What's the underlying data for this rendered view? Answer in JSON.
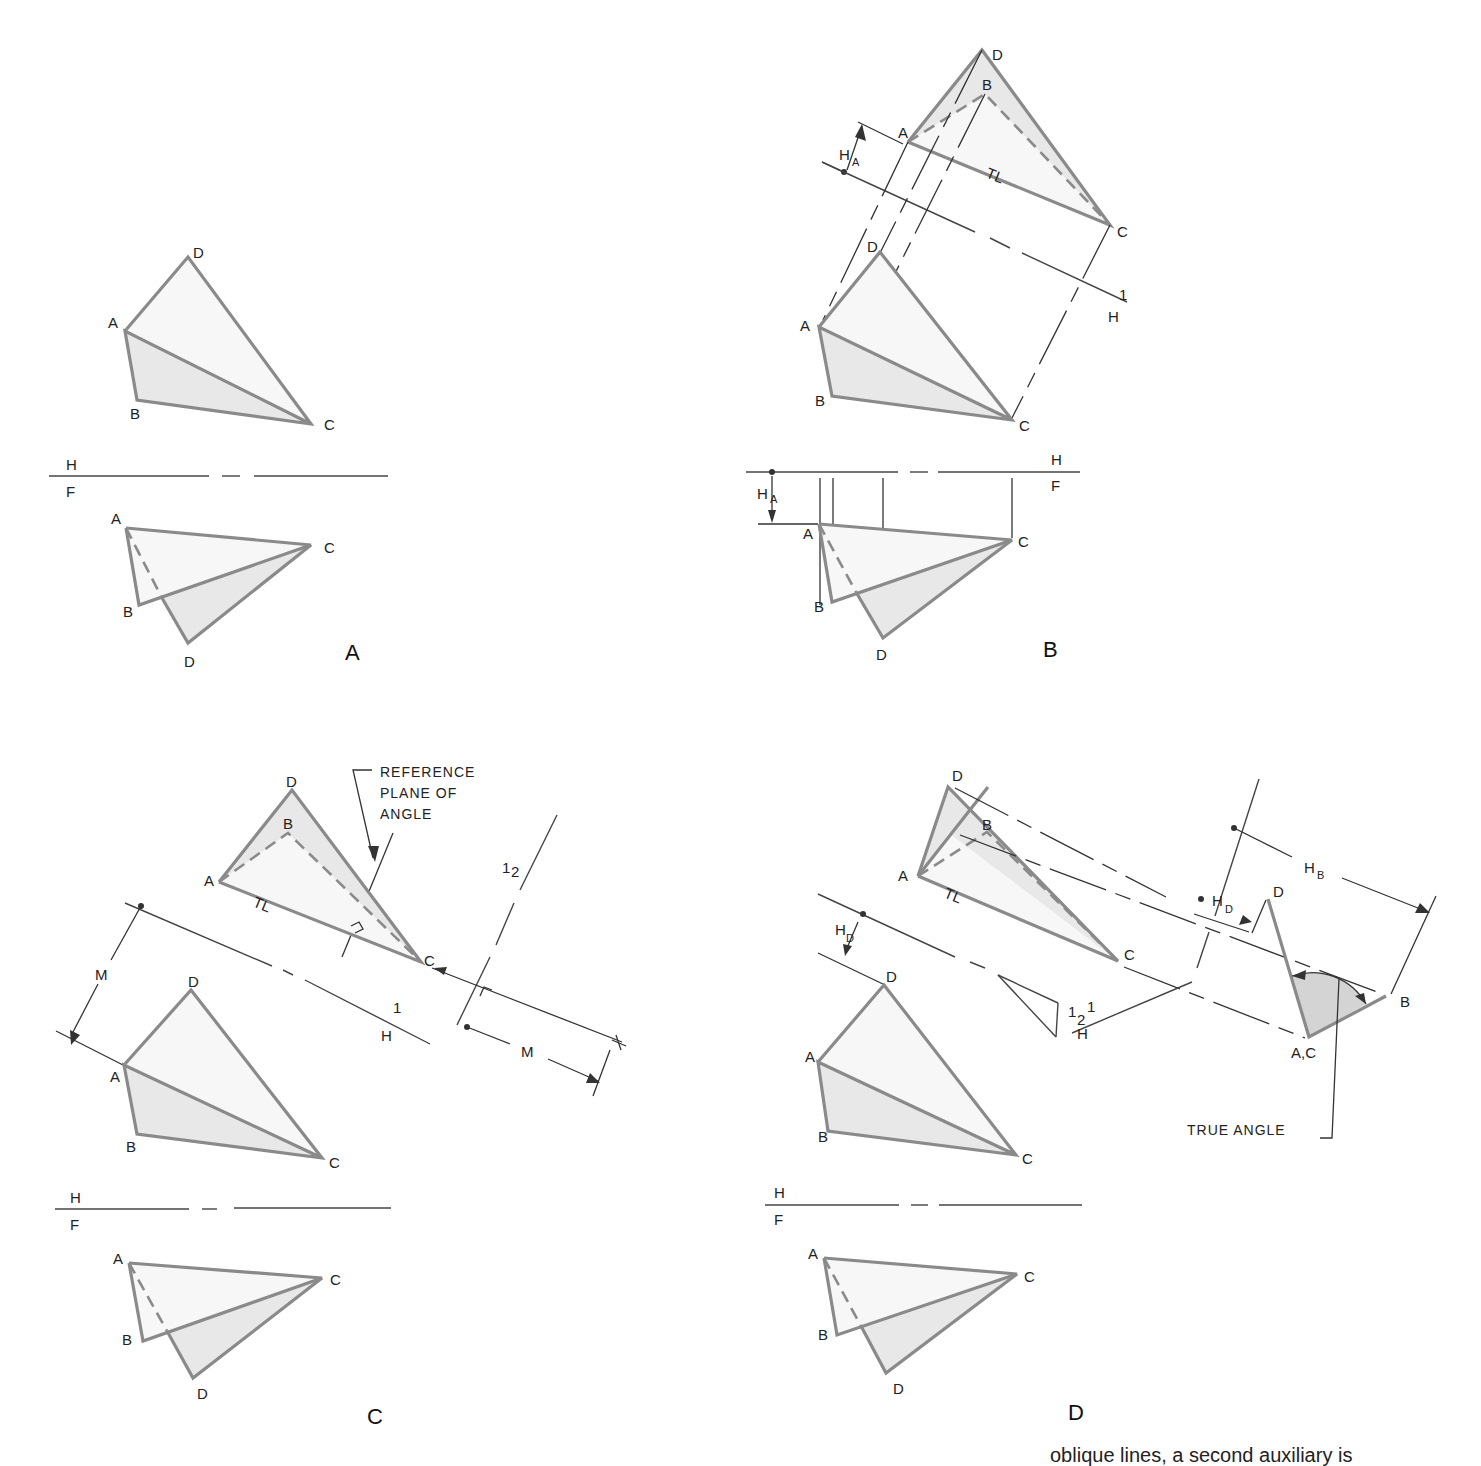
{
  "figure": {
    "panels": [
      {
        "id": "A",
        "caption": "A",
        "top_view": {
          "labels": [
            "A",
            "B",
            "C",
            "D"
          ]
        },
        "fold_line": {
          "upper": "H",
          "lower": "F"
        },
        "front_view": {
          "labels": [
            "A",
            "B",
            "C",
            "D"
          ]
        }
      },
      {
        "id": "B",
        "caption": "B",
        "aux_view": {
          "labels": [
            "A",
            "B",
            "C",
            "D"
          ],
          "true_length": "TL",
          "dim": "H",
          "dim_sub": "A"
        },
        "fold_line_1": {
          "upper": "1",
          "lower": "H"
        },
        "top_view": {
          "labels": [
            "A",
            "B",
            "C",
            "D"
          ]
        },
        "fold_line": {
          "upper": "H",
          "lower": "F"
        },
        "front_view": {
          "labels": [
            "A",
            "B",
            "C",
            "D"
          ],
          "dim": "H",
          "dim_sub": "A"
        }
      },
      {
        "id": "C",
        "caption": "C",
        "aux_view": {
          "labels": [
            "A",
            "B",
            "C",
            "D"
          ],
          "true_length": "TL"
        },
        "note": [
          "REFERENCE",
          "PLANE OF",
          "ANGLE"
        ],
        "fold_line_12": {
          "left": "1",
          "right": "2"
        },
        "fold_line_1": {
          "upper": "1",
          "lower": "H"
        },
        "dim_m": "M",
        "top_view": {
          "labels": [
            "A",
            "B",
            "C",
            "D"
          ]
        },
        "fold_line": {
          "upper": "H",
          "lower": "F"
        },
        "front_view": {
          "labels": [
            "A",
            "B",
            "C",
            "D"
          ]
        }
      },
      {
        "id": "D",
        "caption": "D",
        "aux_view": {
          "labels": [
            "A",
            "B",
            "C",
            "D"
          ],
          "true_length": "TL"
        },
        "aux2_view": {
          "labels": [
            "D",
            "B",
            "A,C"
          ]
        },
        "dims": {
          "hb": "H",
          "hb_sub": "B",
          "hd": "H",
          "hd_sub": "D"
        },
        "true_angle": "TRUE ANGLE",
        "fold_line_12": {
          "left": "1",
          "right": "2"
        },
        "fold_line_1": {
          "upper": "1",
          "lower": "H"
        },
        "top_view": {
          "labels": [
            "A",
            "B",
            "C",
            "D"
          ]
        },
        "fold_line": {
          "upper": "H",
          "lower": "F"
        },
        "front_view": {
          "labels": [
            "A",
            "B",
            "C",
            "D"
          ]
        }
      }
    ],
    "caption_fragment": "oblique lines, a second auxiliary is"
  }
}
